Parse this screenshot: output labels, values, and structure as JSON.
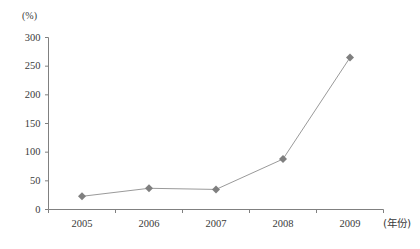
{
  "chart_data": {
    "type": "line",
    "title": "",
    "subtitle": "",
    "xlabel": "(年份)",
    "ylabel": "(%)",
    "categories": [
      "2005",
      "2006",
      "2007",
      "2008",
      "2009"
    ],
    "values": [
      23,
      37,
      35,
      88,
      265
    ],
    "series": [
      {
        "name": "",
        "values": [
          23,
          37,
          35,
          88,
          265
        ]
      }
    ],
    "ylim": [
      0,
      300
    ],
    "y_ticks": [
      0,
      50,
      100,
      150,
      200,
      250,
      300
    ],
    "y_tick_labels": [
      "0",
      "50",
      "100",
      "150",
      "200",
      "250",
      "300"
    ],
    "grid": false,
    "legend": "none",
    "marker": "diamond",
    "colors": {
      "line": "#9a9a9a",
      "marker": "#7f7f7f",
      "axis": "#808080",
      "text": "#3a3a3a",
      "background": "#ffffff"
    }
  }
}
